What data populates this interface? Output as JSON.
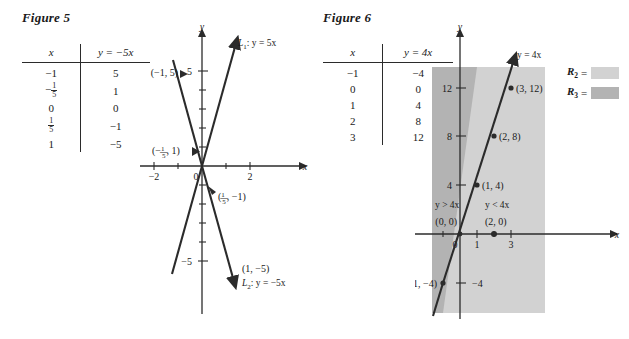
{
  "figure5": {
    "title": "Figure 5",
    "table": {
      "headers": [
        "x",
        "y = −5x"
      ],
      "rows": [
        {
          "x": "−1",
          "x_frac": null,
          "y": "5"
        },
        {
          "x": null,
          "x_frac": {
            "num": "1",
            "den": "5",
            "sign": "−"
          },
          "y": "1"
        },
        {
          "x": "0",
          "x_frac": null,
          "y": "0"
        },
        {
          "x": null,
          "x_frac": {
            "num": "1",
            "den": "5",
            "sign": ""
          },
          "y": "−1"
        },
        {
          "x": "1",
          "x_frac": null,
          "y": "−5"
        }
      ]
    },
    "axes": {
      "x_label": "x",
      "y_label": "y",
      "x_ticks": [
        "−2",
        "0",
        "2"
      ],
      "y_ticks": [
        "5",
        "−5"
      ],
      "xlim": [
        -2.6,
        2.6
      ],
      "ylim": [
        -6.6,
        6.6
      ]
    },
    "lines": [
      {
        "name": "L₁: y = 5x",
        "label_l": "L",
        "label_sub": "1",
        "label_eq": ": y = 5x",
        "slope": 5
      },
      {
        "name": "L₂: y = −5x",
        "label_l": "L",
        "label_sub": "2",
        "label_eq": ": y = −5x",
        "slope": -5
      }
    ],
    "point_labels": [
      "(−1, 5)",
      "(1, −5)"
    ],
    "frac_point_labels": [
      {
        "prefix": "(−",
        "num": "1",
        "den": "5",
        "suffix": ", 1)"
      },
      {
        "prefix": "(",
        "num": "1",
        "den": "5",
        "suffix": ", −1)"
      }
    ]
  },
  "figure6": {
    "title": "Figure 6",
    "table": {
      "headers": [
        "x",
        "y = 4x"
      ],
      "rows": [
        {
          "x": "−1",
          "y": "−4"
        },
        {
          "x": "0",
          "y": "0"
        },
        {
          "x": "1",
          "y": "4"
        },
        {
          "x": "2",
          "y": "8"
        },
        {
          "x": "3",
          "y": "12"
        }
      ]
    },
    "axes": {
      "x_label": "x",
      "y_label": "y",
      "x_ticks": [
        "0",
        "1",
        "3"
      ],
      "y_ticks": [
        "12",
        "8",
        "4",
        "−4"
      ],
      "xlim": [
        -1.9,
        4.4
      ],
      "ylim": [
        -7.5,
        15.5
      ]
    },
    "line": {
      "name": "y = 4x",
      "slope": 4
    },
    "points": [
      {
        "label": "(3, 12)",
        "x": 3,
        "y": 12
      },
      {
        "label": "(2, 8)",
        "x": 2,
        "y": 8
      },
      {
        "label": "(1, 4)",
        "x": 1,
        "y": 4
      },
      {
        "label": "(0, 0)",
        "x": 0,
        "y": 0
      },
      {
        "label": "(2, 0)",
        "x": 2,
        "y": 0
      },
      {
        "label": "(−1, −4)",
        "x": -1,
        "y": -4
      }
    ],
    "region_labels": [
      {
        "text": "y > 4x",
        "region": "R3"
      },
      {
        "text": "y < 4x",
        "region": "R2"
      }
    ],
    "legend": [
      {
        "key": "R",
        "sub": "2",
        "eq": "=",
        "color": "#d2d2d2"
      },
      {
        "key": "R",
        "sub": "3",
        "eq": "=",
        "color": "#b3b3b3"
      }
    ],
    "colors": {
      "region_light": "#d2d2d2",
      "region_dark": "#b3b3b3",
      "ink": "#2b2b2b"
    }
  }
}
